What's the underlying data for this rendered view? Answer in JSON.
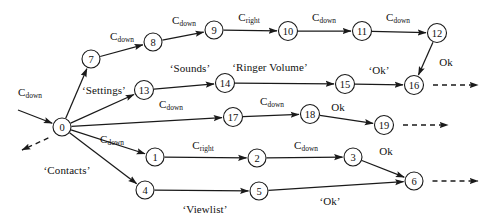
{
  "diagram": {
    "type": "directed-graph",
    "canvas": {
      "width": 494,
      "height": 220
    },
    "colors": {
      "stroke": "#1a1a1a",
      "node_fill": "#ffffff",
      "background": "#ffffff"
    },
    "nodes": [
      {
        "id": "0",
        "label": "0",
        "x": 62,
        "y": 127,
        "r": 9
      },
      {
        "id": "7",
        "label": "7",
        "x": 91,
        "y": 59,
        "r": 9
      },
      {
        "id": "8",
        "label": "8",
        "x": 153,
        "y": 42,
        "r": 9
      },
      {
        "id": "9",
        "label": "9",
        "x": 214,
        "y": 30,
        "r": 9
      },
      {
        "id": "10",
        "label": "10",
        "x": 288,
        "y": 31,
        "r": 9.5
      },
      {
        "id": "11",
        "label": "11",
        "x": 362,
        "y": 31,
        "r": 9.5
      },
      {
        "id": "12",
        "label": "12",
        "x": 437,
        "y": 33,
        "r": 9.5
      },
      {
        "id": "13",
        "label": "13",
        "x": 144,
        "y": 90,
        "r": 9.5
      },
      {
        "id": "14",
        "label": "14",
        "x": 225,
        "y": 83,
        "r": 9.5
      },
      {
        "id": "15",
        "label": "15",
        "x": 345,
        "y": 84,
        "r": 9.5
      },
      {
        "id": "16",
        "label": "16",
        "x": 414,
        "y": 85,
        "r": 9.5
      },
      {
        "id": "17",
        "label": "17",
        "x": 233,
        "y": 117,
        "r": 9.5
      },
      {
        "id": "18",
        "label": "18",
        "x": 310,
        "y": 114,
        "r": 9.5
      },
      {
        "id": "19",
        "label": "19",
        "x": 384,
        "y": 125,
        "r": 9.5
      },
      {
        "id": "1",
        "label": "1",
        "x": 155,
        "y": 157,
        "r": 9
      },
      {
        "id": "2",
        "label": "2",
        "x": 257,
        "y": 158,
        "r": 9
      },
      {
        "id": "3",
        "label": "3",
        "x": 353,
        "y": 157,
        "r": 9
      },
      {
        "id": "4",
        "label": "4",
        "x": 145,
        "y": 190,
        "r": 9
      },
      {
        "id": "5",
        "label": "5",
        "x": 259,
        "y": 191,
        "r": 9
      },
      {
        "id": "6",
        "label": "6",
        "x": 414,
        "y": 181,
        "r": 9
      }
    ],
    "edges": [
      {
        "from": "entry",
        "to": "0",
        "x1": 18,
        "y1": 110,
        "x2": 62,
        "y2": 127,
        "style": "solid",
        "arrow": true
      },
      {
        "from": "0",
        "to": "exit-left",
        "x1": 57,
        "y1": 134,
        "x2": 22,
        "y2": 150,
        "style": "dashed",
        "arrow": true
      },
      {
        "from": "0",
        "to": "7",
        "x1": 62,
        "y1": 127,
        "x2": 91,
        "y2": 59,
        "style": "solid",
        "arrow": true
      },
      {
        "from": "7",
        "to": "8",
        "x1": 91,
        "y1": 59,
        "x2": 153,
        "y2": 42,
        "style": "solid",
        "arrow": true
      },
      {
        "from": "8",
        "to": "9",
        "x1": 153,
        "y1": 42,
        "x2": 214,
        "y2": 30,
        "style": "solid",
        "arrow": true
      },
      {
        "from": "9",
        "to": "10",
        "x1": 214,
        "y1": 30,
        "x2": 288,
        "y2": 31,
        "style": "solid",
        "arrow": true
      },
      {
        "from": "10",
        "to": "11",
        "x1": 288,
        "y1": 31,
        "x2": 362,
        "y2": 31,
        "style": "solid",
        "arrow": true
      },
      {
        "from": "11",
        "to": "12",
        "x1": 362,
        "y1": 31,
        "x2": 437,
        "y2": 33,
        "style": "solid",
        "arrow": true
      },
      {
        "from": "12",
        "to": "16",
        "x1": 437,
        "y1": 33,
        "x2": 414,
        "y2": 85,
        "style": "solid",
        "arrow": true
      },
      {
        "from": "0",
        "to": "13",
        "x1": 62,
        "y1": 127,
        "x2": 144,
        "y2": 90,
        "style": "solid",
        "arrow": true
      },
      {
        "from": "13",
        "to": "14",
        "x1": 144,
        "y1": 90,
        "x2": 225,
        "y2": 83,
        "style": "solid",
        "arrow": true
      },
      {
        "from": "14",
        "to": "15",
        "x1": 225,
        "y1": 83,
        "x2": 345,
        "y2": 84,
        "style": "solid",
        "arrow": true
      },
      {
        "from": "15",
        "to": "16",
        "x1": 345,
        "y1": 84,
        "x2": 414,
        "y2": 85,
        "style": "solid",
        "arrow": true
      },
      {
        "from": "16",
        "to": "exit-16",
        "x1": 423,
        "y1": 85,
        "x2": 478,
        "y2": 85,
        "style": "dashed",
        "arrow": true
      },
      {
        "from": "0",
        "to": "17",
        "x1": 62,
        "y1": 127,
        "x2": 233,
        "y2": 117,
        "style": "solid",
        "arrow": true
      },
      {
        "from": "17",
        "to": "18",
        "x1": 233,
        "y1": 117,
        "x2": 310,
        "y2": 114,
        "style": "solid",
        "arrow": true
      },
      {
        "from": "18",
        "to": "19",
        "x1": 310,
        "y1": 114,
        "x2": 384,
        "y2": 125,
        "style": "solid",
        "arrow": true
      },
      {
        "from": "19",
        "to": "exit-19",
        "x1": 393,
        "y1": 125,
        "x2": 448,
        "y2": 125,
        "style": "dashed",
        "arrow": true
      },
      {
        "from": "0",
        "to": "1",
        "x1": 62,
        "y1": 127,
        "x2": 155,
        "y2": 157,
        "style": "solid",
        "arrow": true
      },
      {
        "from": "1",
        "to": "2",
        "x1": 155,
        "y1": 157,
        "x2": 257,
        "y2": 158,
        "style": "solid",
        "arrow": true
      },
      {
        "from": "2",
        "to": "3",
        "x1": 257,
        "y1": 158,
        "x2": 353,
        "y2": 157,
        "style": "solid",
        "arrow": true
      },
      {
        "from": "3",
        "to": "6",
        "x1": 353,
        "y1": 157,
        "x2": 414,
        "y2": 181,
        "style": "solid",
        "arrow": true
      },
      {
        "from": "0",
        "to": "4",
        "x1": 62,
        "y1": 127,
        "x2": 145,
        "y2": 190,
        "style": "solid",
        "arrow": true
      },
      {
        "from": "4",
        "to": "5",
        "x1": 145,
        "y1": 190,
        "x2": 259,
        "y2": 191,
        "style": "solid",
        "arrow": true
      },
      {
        "from": "5",
        "to": "6",
        "x1": 259,
        "y1": 191,
        "x2": 414,
        "y2": 181,
        "style": "solid",
        "arrow": true
      },
      {
        "from": "6",
        "to": "exit-6",
        "x1": 423,
        "y1": 181,
        "x2": 478,
        "y2": 181,
        "style": "dashed",
        "arrow": true
      }
    ],
    "edge_labels": [
      {
        "id": "lbl-0-7",
        "text": "C",
        "sub": "down",
        "quoted": false,
        "x": 30,
        "y": 92
      },
      {
        "id": "lbl-7-8",
        "text": "C",
        "sub": "down",
        "quoted": false,
        "x": 122,
        "y": 36
      },
      {
        "id": "lbl-8-9",
        "text": "C",
        "sub": "down",
        "quoted": false,
        "x": 184,
        "y": 20
      },
      {
        "id": "lbl-9-10",
        "text": "C",
        "sub": "right",
        "quoted": false,
        "x": 249,
        "y": 17
      },
      {
        "id": "lbl-10-11",
        "text": "C",
        "sub": "down",
        "quoted": false,
        "x": 324,
        "y": 17
      },
      {
        "id": "lbl-11-12",
        "text": "C",
        "sub": "down",
        "quoted": false,
        "x": 398,
        "y": 17
      },
      {
        "id": "lbl-12-16",
        "text": "Ok",
        "sub": "",
        "quoted": false,
        "x": 446,
        "y": 62
      },
      {
        "id": "lbl-0-13",
        "text": "‘Settings’",
        "sub": "",
        "quoted": true,
        "x": 104,
        "y": 90
      },
      {
        "id": "lbl-13-14",
        "text": "‘Sounds’",
        "sub": "",
        "quoted": true,
        "x": 190,
        "y": 68
      },
      {
        "id": "lbl-14-15",
        "text": "‘Ringer Volume’",
        "sub": "",
        "quoted": true,
        "x": 270,
        "y": 67
      },
      {
        "id": "lbl-15-16",
        "text": "‘Ok’",
        "sub": "",
        "quoted": true,
        "x": 379,
        "y": 70
      },
      {
        "id": "lbl-0-17",
        "text": "C",
        "sub": "down",
        "quoted": false,
        "x": 171,
        "y": 104
      },
      {
        "id": "lbl-17-18",
        "text": "C",
        "sub": "down",
        "quoted": false,
        "x": 272,
        "y": 101
      },
      {
        "id": "lbl-18-19",
        "text": "Ok",
        "sub": "",
        "quoted": false,
        "x": 338,
        "y": 107
      },
      {
        "id": "lbl-0-1",
        "text": "C",
        "sub": "down",
        "quoted": false,
        "x": 112,
        "y": 139
      },
      {
        "id": "lbl-1-2",
        "text": "C",
        "sub": "right",
        "quoted": false,
        "x": 203,
        "y": 145
      },
      {
        "id": "lbl-2-3",
        "text": "C",
        "sub": "down",
        "quoted": false,
        "x": 306,
        "y": 145
      },
      {
        "id": "lbl-3-6",
        "text": "Ok",
        "sub": "",
        "quoted": false,
        "x": 386,
        "y": 151
      },
      {
        "id": "lbl-0-4",
        "text": "‘Contacts’",
        "sub": "",
        "quoted": true,
        "x": 67,
        "y": 170
      },
      {
        "id": "lbl-4-5",
        "text": "‘Viewlist’",
        "sub": "",
        "quoted": true,
        "x": 205,
        "y": 209
      },
      {
        "id": "lbl-5-6",
        "text": "‘Ok’",
        "sub": "",
        "quoted": true,
        "x": 330,
        "y": 201
      }
    ]
  }
}
